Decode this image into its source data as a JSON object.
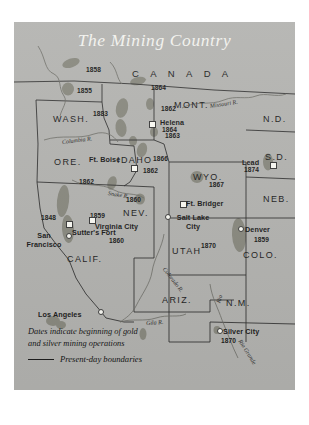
{
  "map": {
    "title": "The Mining Country",
    "region_labels": [
      {
        "name": "canada",
        "text": "C A N A D A",
        "x": 118,
        "y": 46,
        "cls": "canada"
      },
      {
        "name": "wash",
        "text": "WASH.",
        "x": 39,
        "y": 92,
        "cls": "state"
      },
      {
        "name": "ore",
        "text": "ORE.",
        "x": 40,
        "y": 135,
        "cls": "state"
      },
      {
        "name": "idaho",
        "text": "IDAHO",
        "x": 103,
        "y": 133,
        "cls": "state"
      },
      {
        "name": "mont",
        "text": "MONT.",
        "x": 160,
        "y": 78,
        "cls": "state"
      },
      {
        "name": "nd",
        "text": "N.D.",
        "x": 249,
        "y": 92,
        "cls": "state"
      },
      {
        "name": "sd",
        "text": "S.D.",
        "x": 251,
        "y": 130,
        "cls": "state"
      },
      {
        "name": "neb",
        "text": "NEB.",
        "x": 249,
        "y": 172,
        "cls": "state"
      },
      {
        "name": "wyo",
        "text": "WYO.",
        "x": 179,
        "y": 150,
        "cls": "state"
      },
      {
        "name": "nev",
        "text": "NEV.",
        "x": 109,
        "y": 186,
        "cls": "state"
      },
      {
        "name": "utah",
        "text": "UTAH",
        "x": 158,
        "y": 224,
        "cls": "state"
      },
      {
        "name": "colo",
        "text": "COLO.",
        "x": 229,
        "y": 228,
        "cls": "state"
      },
      {
        "name": "calif",
        "text": "CALIF.",
        "x": 53,
        "y": 232,
        "cls": "state"
      },
      {
        "name": "ariz",
        "text": "ARIZ.",
        "x": 148,
        "y": 273,
        "cls": "state"
      },
      {
        "name": "nm",
        "text": "N.M.",
        "x": 212,
        "y": 276,
        "cls": "state"
      }
    ],
    "rivers": [
      {
        "name": "columbia-river",
        "text": "Columbia  R.",
        "x": 48,
        "y": 117,
        "rot": -7
      },
      {
        "name": "snake-river",
        "text": "Snake   R.",
        "x": 94,
        "y": 168,
        "rot": 9
      },
      {
        "name": "missouri-river",
        "text": "Missouri  R.",
        "x": 196,
        "y": 81,
        "rot": -9
      },
      {
        "name": "colorado-river",
        "text": "Colorado  R.",
        "x": 150,
        "y": 243,
        "rot": 52
      },
      {
        "name": "gila-river",
        "text": "Gila      R.",
        "x": 132,
        "y": 298,
        "rot": -4
      },
      {
        "name": "rio-grande-river",
        "text": "Rio Grande",
        "x": 226,
        "y": 315,
        "rot": 58
      },
      {
        "name": "rio-river",
        "text": "Rio",
        "x": 204,
        "y": 278,
        "rot": -72
      }
    ],
    "dates": [
      {
        "name": "date-1858",
        "text": "1858",
        "x": 72,
        "y": 44
      },
      {
        "name": "date-1855",
        "text": "1855",
        "x": 63,
        "y": 65
      },
      {
        "name": "date-1864-north",
        "text": "1864",
        "x": 137,
        "y": 62
      },
      {
        "name": "date-1883",
        "text": "1883",
        "x": 79,
        "y": 88
      },
      {
        "name": "date-1862-mont",
        "text": "1862",
        "x": 147,
        "y": 83
      },
      {
        "name": "date-1863",
        "text": "1863",
        "x": 151,
        "y": 110
      },
      {
        "name": "date-1866",
        "text": "1866",
        "x": 139,
        "y": 133
      },
      {
        "name": "date-1862-idaho",
        "text": "1862",
        "x": 129,
        "y": 145
      },
      {
        "name": "date-1862-ore",
        "text": "1862",
        "x": 65,
        "y": 156
      },
      {
        "name": "date-1867",
        "text": "1867",
        "x": 195,
        "y": 159
      },
      {
        "name": "date-1848",
        "text": "1848",
        "x": 27,
        "y": 192
      },
      {
        "name": "date-1860-nev",
        "text": "1860",
        "x": 112,
        "y": 174
      },
      {
        "name": "date-1859-virginia",
        "text": "1859",
        "x": 76,
        "y": 190
      },
      {
        "name": "date-1860-sutter",
        "text": "1860",
        "x": 95,
        "y": 215
      },
      {
        "name": "date-1870-utah",
        "text": "1870",
        "x": 187,
        "y": 220
      },
      {
        "name": "date-1859-denver",
        "text": "1859",
        "x": 240,
        "y": 214
      },
      {
        "name": "date-1870-silver",
        "text": "1870",
        "x": 207,
        "y": 315
      }
    ],
    "cities": [
      {
        "name": "city-helena",
        "label": "Helena",
        "date": "1864",
        "lx": 146,
        "ly": 96,
        "mx": 135,
        "my": 99,
        "marker": "sq"
      },
      {
        "name": "city-lead",
        "label": "Lead",
        "date": "1874",
        "lx": 228,
        "ly": 136,
        "mx": 256,
        "my": 140,
        "marker": "sq"
      },
      {
        "name": "city-ft-boise",
        "label": "Ft. Boise",
        "date": "",
        "lx": 75,
        "ly": 133,
        "mx": 117,
        "my": 143,
        "marker": "sq"
      },
      {
        "name": "city-ft-bridger",
        "label": "Ft. Bridger",
        "date": "",
        "lx": 172,
        "ly": 177,
        "mx": 166,
        "my": 179,
        "marker": "sq"
      },
      {
        "name": "city-salt-lake-city",
        "label": "Salt Lake City",
        "date": "",
        "lx": 157,
        "ly": 191,
        "mx": 151,
        "my": 192,
        "marker": "dot"
      },
      {
        "name": "city-denver",
        "label": "Denver",
        "date": "",
        "lx": 231,
        "ly": 203,
        "mx": 224,
        "my": 204,
        "marker": "dot"
      },
      {
        "name": "city-virginia-city",
        "label": "Virginia City",
        "date": "",
        "lx": 81,
        "ly": 200,
        "mx": 75,
        "my": 195,
        "marker": "sq"
      },
      {
        "name": "city-sutters-fort",
        "label": "Sutter's Fort",
        "date": "",
        "lx": 58,
        "ly": 206,
        "mx": 52,
        "my": 199,
        "marker": "sq"
      },
      {
        "name": "city-san-francisco",
        "label": "San Francisco",
        "date": "",
        "lx": 8,
        "ly": 209,
        "mx": 52,
        "my": 211,
        "marker": "dot"
      },
      {
        "name": "city-los-angeles",
        "label": "Los Angeles",
        "date": "",
        "lx": 24,
        "ly": 288,
        "mx": 84,
        "my": 287,
        "marker": "dot"
      },
      {
        "name": "city-silver-city",
        "label": "Silver City",
        "date": "",
        "lx": 209,
        "ly": 305,
        "mx": 203,
        "my": 306,
        "marker": "dot"
      }
    ],
    "legend": {
      "line1": "Dates indicate beginning of gold",
      "line2": "and silver mining operations",
      "boundaries": "Present-day boundaries"
    },
    "colors": {
      "background": "#b4b4b1",
      "deposit": "#8a8a80",
      "boundary": "#2e2e2e",
      "title": "#f2f2ee"
    }
  }
}
